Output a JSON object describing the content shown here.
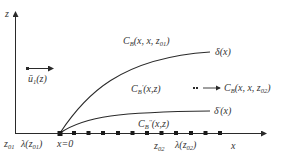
{
  "diagram": {
    "type": "boundary-layer concentration schematic",
    "colors": {
      "line": "#2a2a2a",
      "text": "#333333",
      "background": "#ffffff"
    },
    "axes": {
      "vertical": {
        "label": "z"
      },
      "horizontal": {
        "label": "x"
      }
    },
    "velocity": {
      "symbol": "ū",
      "subscript": "1",
      "argument": "(z)"
    },
    "curves": [
      {
        "id": "upper",
        "label_base": "δ",
        "label_suffix": "(x)"
      },
      {
        "id": "lower",
        "label_base": "δ",
        "label_prime": "'",
        "label_suffix": "(x)"
      }
    ],
    "regions": {
      "outer": {
        "base": "C",
        "sub": "B",
        "args": "(x, x, z",
        "args_sub": "01",
        "args_end": ")"
      },
      "middle": {
        "base": "C",
        "sub": "B",
        "prime": "'",
        "args": "(x,z)"
      },
      "inner": {
        "base": "C",
        "sub": "B",
        "prime": "''",
        "args": "(x,z)"
      },
      "downstream": {
        "base": "C",
        "sub": "B",
        "args": "(x, x, z",
        "args_sub": "02",
        "args_end": ")"
      }
    },
    "bottom_labels": {
      "z01": {
        "base": "z",
        "sub": "01"
      },
      "lambda01": {
        "base": "λ(z",
        "sub": "01",
        "end": ")"
      },
      "origin": "x=0",
      "z02": {
        "base": "z",
        "sub": "02"
      },
      "lambda02": {
        "base": "λ(z",
        "sub": "02",
        "end": ")"
      }
    },
    "marker_count": 12
  }
}
